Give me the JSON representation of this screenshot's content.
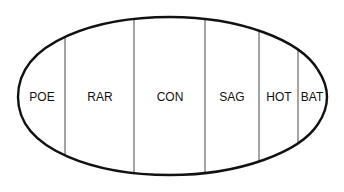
{
  "diagram": {
    "type": "segmented-oval",
    "outline_color": "#111111",
    "divider_color": "#333333",
    "segments": [
      {
        "label": "POE"
      },
      {
        "label": "RAR"
      },
      {
        "label": "CON"
      },
      {
        "label": "SAG"
      },
      {
        "label": "HOT"
      },
      {
        "label": "BAT"
      }
    ]
  }
}
